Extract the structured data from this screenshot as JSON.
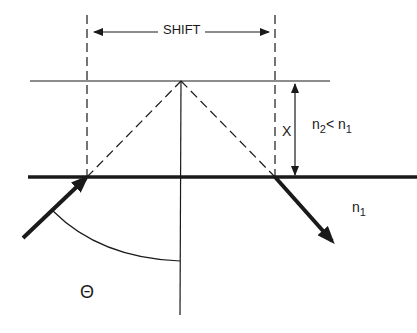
{
  "diagram": {
    "type": "optics-goos-hanchen-shift",
    "labels": {
      "shift": "SHIFT",
      "x": "X",
      "relation": {
        "n2": "n",
        "n2_sub": "2",
        "op": "<",
        "n1": "n",
        "n1_sub": "1"
      },
      "medium": {
        "n": "n",
        "sub": "1"
      },
      "angle": "Θ"
    },
    "colors": {
      "line": "#1a1a1a",
      "background": "#ffffff"
    },
    "elements": [
      "upper-boundary-line",
      "interface-line",
      "normal-line",
      "left-dashed-vertical",
      "right-dashed-vertical",
      "dashed-incident-path",
      "dashed-reflected-path",
      "incident-ray-arrow",
      "reflected-ray-arrow",
      "shift-dimension-arrow",
      "x-dimension-arrow",
      "angle-arc"
    ]
  }
}
